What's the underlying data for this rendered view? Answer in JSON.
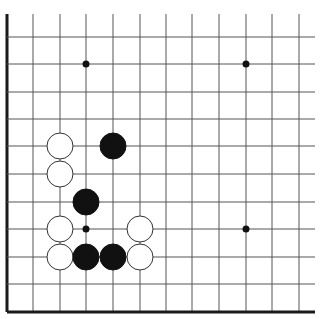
{
  "board": {
    "description": "Go board corner diagram (lower-left section)",
    "background": "#ffffff",
    "line_color": "#555555",
    "edge_color": "#1a1a1a",
    "columns_x": [
      7,
      33,
      60,
      86,
      113,
      140,
      166,
      192,
      219,
      246,
      272,
      299
    ],
    "rows_y": [
      37,
      64,
      92,
      119,
      146,
      174,
      202,
      229,
      257,
      284,
      312
    ],
    "line_top": 14,
    "line_right": 315,
    "left_edge_x": 7,
    "bottom_edge_y": 312,
    "stone_radius": 13,
    "star_radius": 3.5,
    "star_points": [
      {
        "col": 3,
        "row": 1
      },
      {
        "col": 9,
        "row": 1
      },
      {
        "col": 9,
        "row": 7
      },
      {
        "col": 3,
        "row": 7
      }
    ],
    "stones": [
      {
        "color": "white",
        "col": 2,
        "row": 4
      },
      {
        "color": "black",
        "col": 4,
        "row": 4
      },
      {
        "color": "white",
        "col": 2,
        "row": 5
      },
      {
        "color": "black",
        "col": 3,
        "row": 6
      },
      {
        "color": "white",
        "col": 2,
        "row": 7
      },
      {
        "color": "white",
        "col": 5,
        "row": 7
      },
      {
        "color": "white",
        "col": 2,
        "row": 8
      },
      {
        "color": "black",
        "col": 3,
        "row": 8
      },
      {
        "color": "black",
        "col": 4,
        "row": 8
      },
      {
        "color": "white",
        "col": 5,
        "row": 8
      }
    ]
  }
}
